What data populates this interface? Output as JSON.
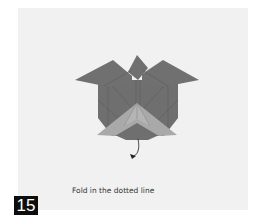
{
  "step": {
    "number": "15",
    "instruction": "Fold in the dotted line"
  },
  "diagram": {
    "colors": {
      "paper_dark": "#6f6f6f",
      "paper_light": "#a9a9a9",
      "crease": "#5a5a5a",
      "background": "#f1f1f1",
      "arrow": "#222222"
    },
    "arrow": "fold-arrow"
  }
}
